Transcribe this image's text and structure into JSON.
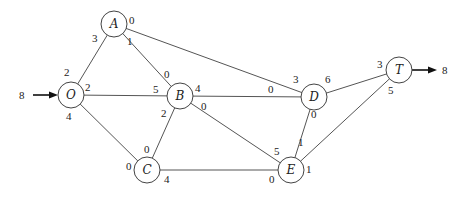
{
  "diagram": {
    "type": "network-flow-graph",
    "source": {
      "node": "O",
      "inflow": "8"
    },
    "sink": {
      "node": "T",
      "outflow": "8"
    },
    "nodes": [
      {
        "id": "O",
        "label": "O"
      },
      {
        "id": "A",
        "label": "A"
      },
      {
        "id": "B",
        "label": "B"
      },
      {
        "id": "C",
        "label": "C"
      },
      {
        "id": "D",
        "label": "D"
      },
      {
        "id": "E",
        "label": "E"
      },
      {
        "id": "T",
        "label": "T"
      }
    ],
    "edges": [
      {
        "from": "O",
        "to": "A",
        "from_label": "2",
        "to_label": "3"
      },
      {
        "from": "O",
        "to": "B",
        "from_label": "2",
        "to_label": "5"
      },
      {
        "from": "O",
        "to": "C",
        "from_label": "4",
        "to_label": "0"
      },
      {
        "from": "A",
        "to": "B",
        "from_label": "1",
        "to_label": "0"
      },
      {
        "from": "A",
        "to": "D",
        "from_label": "0",
        "to_label": "3"
      },
      {
        "from": "B",
        "to": "C",
        "from_label": "2",
        "to_label": "0"
      },
      {
        "from": "B",
        "to": "D",
        "from_label": "4",
        "to_label": "0"
      },
      {
        "from": "B",
        "to": "E",
        "from_label": "0",
        "to_label": "5"
      },
      {
        "from": "C",
        "to": "E",
        "from_label": "4",
        "to_label": "0"
      },
      {
        "from": "D",
        "to": "E",
        "from_label": "0",
        "to_label": "1"
      },
      {
        "from": "D",
        "to": "T",
        "from_label": "6",
        "to_label": "3"
      },
      {
        "from": "E",
        "to": "T",
        "from_label": "1",
        "to_label": "5"
      }
    ]
  }
}
